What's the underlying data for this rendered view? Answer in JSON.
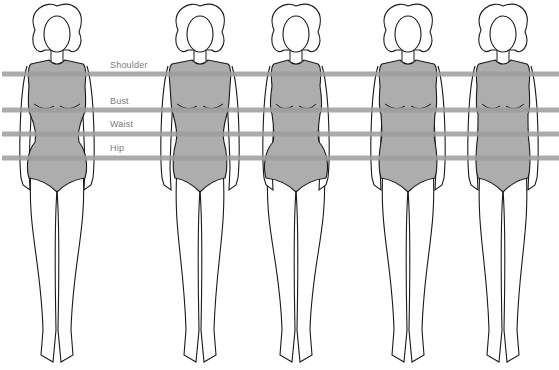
{
  "colors": {
    "line": "#9c9c9c",
    "body_fill": "#adadad",
    "outline": "#1a1a1a",
    "label_text": "#7a7a7a"
  },
  "measurement_lines": [
    {
      "label": "Shoulder",
      "y": 74
    },
    {
      "label": "Bust",
      "y": 110
    },
    {
      "label": "Waist",
      "y": 134
    },
    {
      "label": "Hip",
      "y": 158
    }
  ],
  "figures": [
    {
      "id": 1,
      "center_x": 57,
      "shape": "hourglass"
    },
    {
      "id": 2,
      "center_x": 200,
      "shape": "inverted-triangle"
    },
    {
      "id": 3,
      "center_x": 296,
      "shape": "pear"
    },
    {
      "id": 4,
      "center_x": 408,
      "shape": "rectangle"
    },
    {
      "id": 5,
      "center_x": 503,
      "shape": "straight"
    }
  ]
}
